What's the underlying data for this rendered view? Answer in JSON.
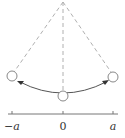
{
  "diagram": {
    "title": "",
    "type": "pendulum-oscillation",
    "pivot": {
      "x": 63,
      "y": 2
    },
    "bobs": [
      {
        "id": "left",
        "x": 12,
        "y": 76
      },
      {
        "id": "center",
        "x": 63,
        "y": 96
      },
      {
        "id": "right",
        "x": 113,
        "y": 77
      }
    ],
    "axis": {
      "ticks": [
        {
          "x": 12,
          "label": "−a"
        },
        {
          "x": 63,
          "label": "0"
        },
        {
          "x": 113,
          "label": "a"
        }
      ]
    },
    "colors": {
      "dashed": "#b0b0b0",
      "arc": "#555555",
      "axis": "#777777",
      "bob": "#888888"
    }
  }
}
